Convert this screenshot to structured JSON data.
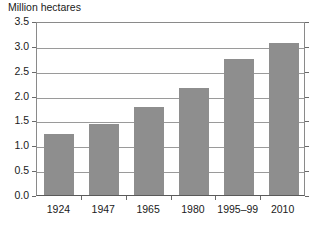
{
  "chart_data": {
    "type": "bar",
    "title": "Million hectares",
    "xlabel": "",
    "ylabel": "",
    "categories": [
      "1924",
      "1947",
      "1965",
      "1980",
      "1995–99",
      "2010"
    ],
    "values": [
      1.22,
      1.43,
      1.78,
      2.16,
      2.74,
      3.06
    ],
    "series": [
      {
        "name": "Area",
        "values": [
          1.22,
          1.43,
          1.78,
          2.16,
          2.74,
          3.06
        ]
      }
    ],
    "ylim": [
      0.0,
      3.5
    ],
    "ytick_labels": [
      "0.0",
      "0.5",
      "1.0",
      "1.5",
      "2.0",
      "2.5",
      "3.0",
      "3.5"
    ],
    "ytick_values": [
      0.0,
      0.5,
      1.0,
      1.5,
      2.0,
      2.5,
      3.0,
      3.5
    ],
    "grid": "horizontal",
    "legend": "none",
    "bar_color": "#8e8e8e",
    "grid_color": "#9a9a9a",
    "axis_color": "#5a5a5a",
    "background": "#ffffff"
  }
}
